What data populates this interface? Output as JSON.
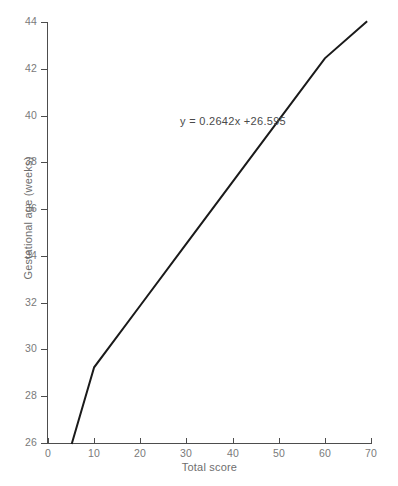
{
  "chart_data": {
    "type": "line",
    "title": "",
    "subtitle": "",
    "xlabel": "Total score",
    "ylabel": "Gestational age (weeks)",
    "xlim": [
      0,
      70
    ],
    "ylim": [
      26,
      44
    ],
    "xticks": [
      0,
      10,
      20,
      30,
      40,
      50,
      60,
      70
    ],
    "yticks": [
      26,
      28,
      30,
      32,
      34,
      36,
      38,
      40,
      42,
      44
    ],
    "xtick_labels": [
      "0",
      "10",
      "20",
      "30",
      "40",
      "50",
      "60",
      "70"
    ],
    "ytick_labels": [
      "26",
      "28",
      "30",
      "32",
      "34",
      "36",
      "38",
      "40",
      "42",
      "44"
    ],
    "grid": false,
    "legend": false,
    "legend_position": "none",
    "annotations": [
      {
        "name": "regression-equation",
        "text": "y = 0.2642x +26.595",
        "x": 24,
        "y": 39.5
      }
    ],
    "series": [
      {
        "name": "regression-line",
        "type": "line",
        "equation": "y = 0.2642x + 26.595",
        "slope": 0.2642,
        "intercept": 26.595,
        "color": "#1a1a1a",
        "line_width": 2,
        "x": [
          5.2,
          69.0
        ],
        "values": [
          26.0,
          44.82
        ],
        "points": [
          {
            "x": 5.2,
            "y": 26.0
          },
          {
            "x": 10,
            "y": 29.237
          },
          {
            "x": 20,
            "y": 31.879
          },
          {
            "x": 30,
            "y": 34.521
          },
          {
            "x": 40,
            "y": 37.163
          },
          {
            "x": 50,
            "y": 39.805
          },
          {
            "x": 60,
            "y": 42.447
          },
          {
            "x": 69.0,
            "y": 44.825
          }
        ]
      }
    ]
  },
  "style": {
    "background": "#ffffff",
    "axis_color": "#4d4d4d",
    "tick_label_color": "#7a7a7a",
    "axis_title_color": "#6e6e6e",
    "line_color": "#1a1a1a",
    "annotation_color": "#4a4a4a"
  }
}
